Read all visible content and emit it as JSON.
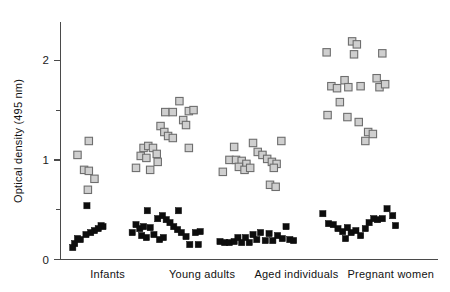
{
  "figure": {
    "background": "#ffffff",
    "axis_color": "#4a4a4a",
    "open_marker_fill": "#cfcfcf",
    "open_marker_stroke": "#6e6e6e",
    "filled_marker_color": "#0d0d0d"
  },
  "chart_data": {
    "type": "scatter",
    "title": "",
    "xlabel": "",
    "ylabel": "Optical density (495 nm)",
    "ylim": [
      0,
      2.45
    ],
    "xlim": [
      0,
      4
    ],
    "grid": false,
    "legend_position": "none",
    "y_major_ticks": [
      "0",
      "1",
      "2"
    ],
    "y_major_values": [
      0,
      1,
      2
    ],
    "y_minor_values": [
      0.5,
      1.5,
      2.5
    ],
    "categories": [
      "Infants",
      "Young adults",
      "Aged individuals",
      "Pregnant women"
    ],
    "series": [
      {
        "name": "open-square",
        "marker": "open-square",
        "points": [
          {
            "group": "Infants",
            "x": 0.3,
            "y": 1.19
          },
          {
            "group": "Infants",
            "x": 0.18,
            "y": 1.05
          },
          {
            "group": "Infants",
            "x": 0.25,
            "y": 0.9
          },
          {
            "group": "Infants",
            "x": 0.3,
            "y": 0.89
          },
          {
            "group": "Infants",
            "x": 0.36,
            "y": 0.81
          },
          {
            "group": "Infants",
            "x": 0.29,
            "y": 0.7
          },
          {
            "group": "Young adults",
            "x": 1.11,
            "y": 1.48
          },
          {
            "group": "Young adults",
            "x": 1.19,
            "y": 1.48
          },
          {
            "group": "Young adults",
            "x": 1.26,
            "y": 1.59
          },
          {
            "group": "Young adults",
            "x": 1.36,
            "y": 1.49
          },
          {
            "group": "Young adults",
            "x": 1.41,
            "y": 1.5
          },
          {
            "group": "Young adults",
            "x": 1.3,
            "y": 1.4
          },
          {
            "group": "Young adults",
            "x": 1.33,
            "y": 1.35
          },
          {
            "group": "Young adults",
            "x": 1.06,
            "y": 1.34
          },
          {
            "group": "Young adults",
            "x": 1.1,
            "y": 1.28
          },
          {
            "group": "Young adults",
            "x": 1.14,
            "y": 1.24
          },
          {
            "group": "Young adults",
            "x": 1.19,
            "y": 1.22
          },
          {
            "group": "Young adults",
            "x": 1.36,
            "y": 1.12
          },
          {
            "group": "Young adults",
            "x": 0.88,
            "y": 1.12
          },
          {
            "group": "Young adults",
            "x": 0.93,
            "y": 1.14
          },
          {
            "group": "Young adults",
            "x": 0.98,
            "y": 1.12
          },
          {
            "group": "Young adults",
            "x": 0.85,
            "y": 1.04
          },
          {
            "group": "Young adults",
            "x": 0.91,
            "y": 1.02
          },
          {
            "group": "Young adults",
            "x": 1.02,
            "y": 1.06
          },
          {
            "group": "Young adults",
            "x": 0.8,
            "y": 0.92
          },
          {
            "group": "Young adults",
            "x": 0.95,
            "y": 0.9
          },
          {
            "group": "Young adults",
            "x": 1.03,
            "y": 0.98
          },
          {
            "group": "Aged individuals",
            "x": 1.84,
            "y": 1.13
          },
          {
            "group": "Aged individuals",
            "x": 2.04,
            "y": 1.17
          },
          {
            "group": "Aged individuals",
            "x": 2.34,
            "y": 1.19
          },
          {
            "group": "Aged individuals",
            "x": 1.79,
            "y": 1.0
          },
          {
            "group": "Aged individuals",
            "x": 1.86,
            "y": 1.0
          },
          {
            "group": "Aged individuals",
            "x": 1.92,
            "y": 0.99
          },
          {
            "group": "Aged individuals",
            "x": 1.97,
            "y": 0.96
          },
          {
            "group": "Aged individuals",
            "x": 2.09,
            "y": 1.08
          },
          {
            "group": "Aged individuals",
            "x": 2.14,
            "y": 1.05
          },
          {
            "group": "Aged individuals",
            "x": 2.19,
            "y": 1.01
          },
          {
            "group": "Aged individuals",
            "x": 2.24,
            "y": 0.98
          },
          {
            "group": "Aged individuals",
            "x": 2.29,
            "y": 0.96
          },
          {
            "group": "Aged individuals",
            "x": 1.89,
            "y": 0.93
          },
          {
            "group": "Aged individuals",
            "x": 1.95,
            "y": 0.9
          },
          {
            "group": "Aged individuals",
            "x": 2.01,
            "y": 0.92
          },
          {
            "group": "Aged individuals",
            "x": 2.26,
            "y": 0.92
          },
          {
            "group": "Aged individuals",
            "x": 1.72,
            "y": 0.88
          },
          {
            "group": "Aged individuals",
            "x": 2.22,
            "y": 0.75
          },
          {
            "group": "Aged individuals",
            "x": 2.28,
            "y": 0.73
          },
          {
            "group": "Pregnant women",
            "x": 2.82,
            "y": 2.08
          },
          {
            "group": "Pregnant women",
            "x": 3.09,
            "y": 2.19
          },
          {
            "group": "Pregnant women",
            "x": 3.14,
            "y": 2.16
          },
          {
            "group": "Pregnant women",
            "x": 3.11,
            "y": 2.06
          },
          {
            "group": "Pregnant women",
            "x": 3.41,
            "y": 2.07
          },
          {
            "group": "Pregnant women",
            "x": 3.01,
            "y": 1.8
          },
          {
            "group": "Pregnant women",
            "x": 3.35,
            "y": 1.82
          },
          {
            "group": "Pregnant women",
            "x": 2.87,
            "y": 1.74
          },
          {
            "group": "Pregnant women",
            "x": 2.93,
            "y": 1.72
          },
          {
            "group": "Pregnant women",
            "x": 3.05,
            "y": 1.73
          },
          {
            "group": "Pregnant women",
            "x": 3.18,
            "y": 1.74
          },
          {
            "group": "Pregnant women",
            "x": 3.38,
            "y": 1.73
          },
          {
            "group": "Pregnant women",
            "x": 3.44,
            "y": 1.76
          },
          {
            "group": "Pregnant women",
            "x": 2.96,
            "y": 1.58
          },
          {
            "group": "Pregnant women",
            "x": 2.83,
            "y": 1.45
          },
          {
            "group": "Pregnant women",
            "x": 3.04,
            "y": 1.43
          },
          {
            "group": "Pregnant women",
            "x": 3.16,
            "y": 1.38
          },
          {
            "group": "Pregnant women",
            "x": 3.26,
            "y": 1.28
          },
          {
            "group": "Pregnant women",
            "x": 3.31,
            "y": 1.26
          },
          {
            "group": "Pregnant women",
            "x": 3.23,
            "y": 1.19
          }
        ]
      },
      {
        "name": "filled-square",
        "marker": "filled-square",
        "points": [
          {
            "group": "Infants",
            "x": 0.28,
            "y": 0.54
          },
          {
            "group": "Infants",
            "x": 0.43,
            "y": 0.34
          },
          {
            "group": "Infants",
            "x": 0.45,
            "y": 0.33
          },
          {
            "group": "Infants",
            "x": 0.4,
            "y": 0.31
          },
          {
            "group": "Infants",
            "x": 0.36,
            "y": 0.29
          },
          {
            "group": "Infants",
            "x": 0.32,
            "y": 0.27
          },
          {
            "group": "Infants",
            "x": 0.27,
            "y": 0.25
          },
          {
            "group": "Infants",
            "x": 0.21,
            "y": 0.2
          },
          {
            "group": "Infants",
            "x": 0.18,
            "y": 0.21
          },
          {
            "group": "Infants",
            "x": 0.15,
            "y": 0.16
          },
          {
            "group": "Infants",
            "x": 0.13,
            "y": 0.12
          },
          {
            "group": "Young adults",
            "x": 0.92,
            "y": 0.49
          },
          {
            "group": "Young adults",
            "x": 1.25,
            "y": 0.49
          },
          {
            "group": "Young adults",
            "x": 1.03,
            "y": 0.41
          },
          {
            "group": "Young adults",
            "x": 1.08,
            "y": 0.44
          },
          {
            "group": "Young adults",
            "x": 1.12,
            "y": 0.4
          },
          {
            "group": "Young adults",
            "x": 1.16,
            "y": 0.37
          },
          {
            "group": "Young adults",
            "x": 1.2,
            "y": 0.33
          },
          {
            "group": "Young adults",
            "x": 1.24,
            "y": 0.3
          },
          {
            "group": "Young adults",
            "x": 1.28,
            "y": 0.27
          },
          {
            "group": "Young adults",
            "x": 1.33,
            "y": 0.23
          },
          {
            "group": "Young adults",
            "x": 1.37,
            "y": 0.15
          },
          {
            "group": "Young adults",
            "x": 0.8,
            "y": 0.35
          },
          {
            "group": "Young adults",
            "x": 0.84,
            "y": 0.31
          },
          {
            "group": "Young adults",
            "x": 0.88,
            "y": 0.33
          },
          {
            "group": "Young adults",
            "x": 0.95,
            "y": 0.32
          },
          {
            "group": "Young adults",
            "x": 0.99,
            "y": 0.25
          },
          {
            "group": "Young adults",
            "x": 0.86,
            "y": 0.24
          },
          {
            "group": "Young adults",
            "x": 0.91,
            "y": 0.22
          },
          {
            "group": "Young adults",
            "x": 1.05,
            "y": 0.2
          },
          {
            "group": "Young adults",
            "x": 1.09,
            "y": 0.22
          },
          {
            "group": "Young adults",
            "x": 0.76,
            "y": 0.27
          },
          {
            "group": "Young adults",
            "x": 1.43,
            "y": 0.27
          },
          {
            "group": "Young adults",
            "x": 1.48,
            "y": 0.28
          },
          {
            "group": "Young adults",
            "x": 1.46,
            "y": 0.15
          },
          {
            "group": "Aged individuals",
            "x": 1.69,
            "y": 0.18
          },
          {
            "group": "Aged individuals",
            "x": 1.74,
            "y": 0.17
          },
          {
            "group": "Aged individuals",
            "x": 1.79,
            "y": 0.17
          },
          {
            "group": "Aged individuals",
            "x": 1.84,
            "y": 0.18
          },
          {
            "group": "Aged individuals",
            "x": 1.88,
            "y": 0.22
          },
          {
            "group": "Aged individuals",
            "x": 1.92,
            "y": 0.17
          },
          {
            "group": "Aged individuals",
            "x": 1.96,
            "y": 0.22
          },
          {
            "group": "Aged individuals",
            "x": 2.0,
            "y": 0.17
          },
          {
            "group": "Aged individuals",
            "x": 2.04,
            "y": 0.25
          },
          {
            "group": "Aged individuals",
            "x": 2.08,
            "y": 0.2
          },
          {
            "group": "Aged individuals",
            "x": 2.12,
            "y": 0.27
          },
          {
            "group": "Aged individuals",
            "x": 2.17,
            "y": 0.19
          },
          {
            "group": "Aged individuals",
            "x": 2.21,
            "y": 0.26
          },
          {
            "group": "Aged individuals",
            "x": 2.25,
            "y": 0.19
          },
          {
            "group": "Aged individuals",
            "x": 2.3,
            "y": 0.24
          },
          {
            "group": "Aged individuals",
            "x": 2.35,
            "y": 0.21
          },
          {
            "group": "Aged individuals",
            "x": 2.39,
            "y": 0.33
          },
          {
            "group": "Aged individuals",
            "x": 2.43,
            "y": 0.2
          },
          {
            "group": "Aged individuals",
            "x": 2.47,
            "y": 0.19
          },
          {
            "group": "Pregnant women",
            "x": 2.78,
            "y": 0.46
          },
          {
            "group": "Pregnant women",
            "x": 2.84,
            "y": 0.36
          },
          {
            "group": "Pregnant women",
            "x": 2.89,
            "y": 0.35
          },
          {
            "group": "Pregnant women",
            "x": 2.94,
            "y": 0.31
          },
          {
            "group": "Pregnant women",
            "x": 2.99,
            "y": 0.28
          },
          {
            "group": "Pregnant women",
            "x": 3.04,
            "y": 0.32
          },
          {
            "group": "Pregnant women",
            "x": 3.08,
            "y": 0.27
          },
          {
            "group": "Pregnant women",
            "x": 3.02,
            "y": 0.21
          },
          {
            "group": "Pregnant women",
            "x": 3.13,
            "y": 0.29
          },
          {
            "group": "Pregnant women",
            "x": 3.18,
            "y": 0.24
          },
          {
            "group": "Pregnant women",
            "x": 3.23,
            "y": 0.31
          },
          {
            "group": "Pregnant women",
            "x": 3.27,
            "y": 0.37
          },
          {
            "group": "Pregnant women",
            "x": 3.32,
            "y": 0.41
          },
          {
            "group": "Pregnant women",
            "x": 3.36,
            "y": 0.4
          },
          {
            "group": "Pregnant women",
            "x": 3.41,
            "y": 0.41
          },
          {
            "group": "Pregnant women",
            "x": 3.46,
            "y": 0.51
          },
          {
            "group": "Pregnant women",
            "x": 3.52,
            "y": 0.44
          },
          {
            "group": "Pregnant women",
            "x": 3.55,
            "y": 0.34
          }
        ]
      }
    ]
  }
}
